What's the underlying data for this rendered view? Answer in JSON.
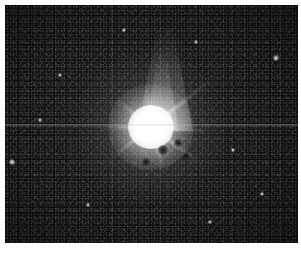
{
  "image": {
    "kind": "astronomical-photograph",
    "subject": "bright saturated star with diffraction spikes",
    "caption": "",
    "title": "",
    "background_color": "#0a0a0a",
    "border_color": "#ffffff",
    "object_color": "#ffffff",
    "width": 301,
    "height": 255
  },
  "frame": {
    "left": 5,
    "top": 5,
    "width": 293,
    "height": 238
  },
  "object": {
    "label": "central-star",
    "center_x": 151,
    "center_y": 127,
    "core_radius": 23,
    "halo_radius": 75
  },
  "artifacts": {
    "scanline_y": 125,
    "scanline_label": "horizontal-scan-line"
  },
  "plume": {
    "label": "upward-glow-plume",
    "top": 23,
    "bottom": 126
  },
  "spikes": [
    {
      "name": "spike-up-right",
      "angle": -38,
      "length": 78
    },
    {
      "name": "spike-right",
      "angle": 4,
      "length": 58
    },
    {
      "name": "spike-down-right",
      "angle": 36,
      "length": 62
    },
    {
      "name": "spike-down",
      "angle": 74,
      "length": 48
    },
    {
      "name": "spike-down-left",
      "angle": 142,
      "length": 52
    },
    {
      "name": "spike-left",
      "angle": 179,
      "length": 55
    },
    {
      "name": "spike-up-left",
      "angle": -142,
      "length": 46
    },
    {
      "name": "spike-up",
      "angle": -96,
      "length": 40
    }
  ],
  "field_stars": [
    {
      "name": "field-star-1",
      "x": 276,
      "y": 58,
      "size": 3
    },
    {
      "name": "field-star-2",
      "x": 12,
      "y": 162,
      "size": 3
    },
    {
      "name": "field-star-3",
      "x": 60,
      "y": 75,
      "size": 2
    },
    {
      "name": "field-star-4",
      "x": 233,
      "y": 150,
      "size": 2
    },
    {
      "name": "field-star-5",
      "x": 196,
      "y": 42,
      "size": 2
    },
    {
      "name": "field-star-6",
      "x": 88,
      "y": 205,
      "size": 2
    },
    {
      "name": "field-star-7",
      "x": 262,
      "y": 194,
      "size": 2
    },
    {
      "name": "field-star-8",
      "x": 40,
      "y": 120,
      "size": 2
    },
    {
      "name": "field-star-9",
      "x": 210,
      "y": 222,
      "size": 2
    },
    {
      "name": "field-star-10",
      "x": 124,
      "y": 30,
      "size": 2
    }
  ],
  "knots": [
    {
      "name": "dark-knot-1",
      "x": 163,
      "y": 150,
      "size": 5
    },
    {
      "name": "dark-knot-2",
      "x": 178,
      "y": 143,
      "size": 4
    },
    {
      "name": "dark-knot-3",
      "x": 146,
      "y": 162,
      "size": 4
    },
    {
      "name": "dark-knot-4",
      "x": 186,
      "y": 156,
      "size": 3
    }
  ]
}
